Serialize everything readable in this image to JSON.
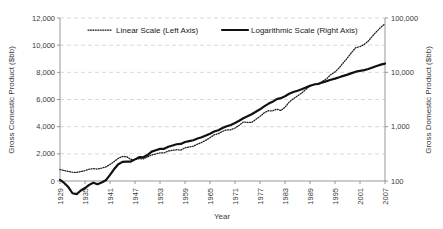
{
  "chart_data": {
    "type": "line",
    "title": "",
    "xlabel": "Year",
    "ylabel": "Gross Comestic Product ($bb)",
    "ylabel_right": "Gross Domestic Product ($bb)",
    "xlim": [
      1929,
      2007
    ],
    "ylim": [
      0,
      12000
    ],
    "ylim_right": [
      100,
      100000
    ],
    "right_axis_scale": "log",
    "grid": true,
    "legend_position": "top-inside",
    "x_tick_labels": [
      "1929",
      "1935",
      "1941",
      "1947",
      "1953",
      "1959",
      "1965",
      "1971",
      "1977",
      "1983",
      "1989",
      "1995",
      "2001",
      "2007"
    ],
    "y_tick_labels_left": [
      "0",
      "2,000",
      "4,000",
      "6,000",
      "8,000",
      "10,000",
      "12,000"
    ],
    "y_tick_values_left": [
      0,
      2000,
      4000,
      6000,
      8000,
      10000,
      12000
    ],
    "y_tick_labels_right": [
      "100",
      "1,000",
      "10,000",
      "100,000"
    ],
    "y_tick_values_right": [
      100,
      1000,
      10000,
      100000
    ],
    "legend": [
      {
        "name": "Linear Scale (Left Axis)",
        "style": "dotted",
        "color": "#1a1a1a"
      },
      {
        "name": "Logarithmic Scale (Right Axis)",
        "style": "solid",
        "color": "#111111"
      }
    ],
    "x": [
      1929,
      1930,
      1931,
      1932,
      1933,
      1934,
      1935,
      1936,
      1937,
      1938,
      1939,
      1940,
      1941,
      1942,
      1943,
      1944,
      1945,
      1946,
      1947,
      1948,
      1949,
      1950,
      1951,
      1952,
      1953,
      1954,
      1955,
      1956,
      1957,
      1958,
      1959,
      1960,
      1961,
      1962,
      1963,
      1964,
      1965,
      1966,
      1967,
      1968,
      1969,
      1970,
      1971,
      1972,
      1973,
      1974,
      1975,
      1976,
      1977,
      1978,
      1979,
      1980,
      1981,
      1982,
      1983,
      1984,
      1985,
      1986,
      1987,
      1988,
      1989,
      1990,
      1991,
      1992,
      1993,
      1994,
      1995,
      1996,
      1997,
      1998,
      1999,
      2000,
      2001,
      2002,
      2003,
      2004,
      2005,
      2006,
      2007
    ],
    "series": [
      {
        "name": "Linear Scale (Left Axis)",
        "axis": "left",
        "scale": "linear",
        "values": [
          845,
          770,
          709,
          644,
          635,
          704,
          766,
          866,
          911,
          879,
          950,
          1035,
          1212,
          1436,
          1670,
          1806,
          1787,
          1590,
          1575,
          1643,
          1634,
          1777,
          1915,
          1988,
          2079,
          2065,
          2213,
          2256,
          2301,
          2280,
          2441,
          2502,
          2560,
          2715,
          2834,
          2999,
          3192,
          3399,
          3485,
          3653,
          3766,
          3772,
          3899,
          4105,
          4342,
          4320,
          4311,
          4541,
          4751,
          5015,
          5173,
          5162,
          5292,
          5189,
          5424,
          5814,
          6054,
          6264,
          6475,
          6743,
          6981,
          7113,
          7101,
          7337,
          7533,
          7836,
          8032,
          8329,
          8704,
          9067,
          9470,
          9817,
          9891,
          10049,
          10301,
          10676,
          11004,
          11320,
          11568
        ]
      },
      {
        "name": "Logarithmic Scale (Right Axis)",
        "axis": "right",
        "scale": "log",
        "values": [
          104.6,
          92.2,
          77.4,
          59.5,
          57.2,
          66.8,
          74.3,
          84.9,
          93.0,
          87.4,
          93.5,
          102.9,
          129.4,
          166.0,
          203.1,
          224.6,
          228.2,
          227.8,
          249.9,
          274.8,
          272.8,
          300.2,
          347.3,
          367.7,
          389.7,
          391.1,
          426.2,
          450.1,
          474.9,
          482.0,
          522.5,
          543.3,
          563.3,
          605.1,
          638.6,
          685.8,
          743.7,
          815.0,
          861.7,
          942.5,
          1019.9,
          1075.9,
          1167.8,
          1282.4,
          1428.5,
          1548.8,
          1688.9,
          1877.6,
          2086.0,
          2356.6,
          2632.1,
          2862.5,
          3211.0,
          3345.0,
          3638.1,
          4040.7,
          4346.7,
          4590.2,
          4870.2,
          5252.6,
          5657.7,
          5979.6,
          6174.0,
          6539.3,
          6878.7,
          7308.8,
          7664.1,
          8100.2,
          8608.5,
          9089.2,
          9660.6,
          10284.8,
          10621.8,
          10977.5,
          11510.7,
          12274.9,
          13093.7,
          13855.9,
          14477.6
        ]
      }
    ]
  }
}
